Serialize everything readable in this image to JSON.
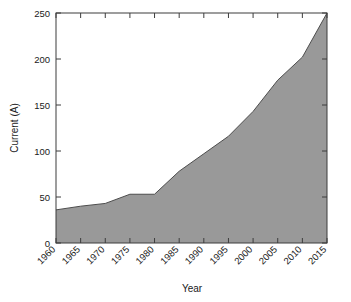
{
  "chart_data": {
    "type": "area",
    "title": "",
    "subtitle": "",
    "xlabel": "Year",
    "ylabel": "Current (A)",
    "x": [
      1960,
      1965,
      1970,
      1975,
      1980,
      1985,
      1990,
      1995,
      2000,
      2005,
      2010,
      2015
    ],
    "values": [
      36,
      40,
      43,
      53,
      53,
      78,
      97,
      116,
      143,
      177,
      202,
      250
    ],
    "series": [
      {
        "name": "Current (A)",
        "values": [
          36,
          40,
          43,
          53,
          53,
          78,
          97,
          116,
          143,
          177,
          202,
          250
        ]
      }
    ],
    "xlim": [
      1960,
      2015
    ],
    "ylim": [
      0,
      250
    ],
    "xticks": [
      1960,
      1965,
      1970,
      1975,
      1980,
      1985,
      1990,
      1995,
      2000,
      2005,
      2010,
      2015
    ],
    "yticks": [
      0,
      50,
      100,
      150,
      200,
      250
    ],
    "xtick_labels": [
      "1960",
      "1965",
      "1970",
      "1975",
      "1980",
      "1985",
      "1990",
      "1995",
      "2000",
      "2005",
      "2010",
      "2015"
    ],
    "ytick_labels": [
      "0",
      "50",
      "100",
      "150",
      "200",
      "250"
    ],
    "xtick_label_rotation": 45,
    "grid": false,
    "legend": null,
    "legend_position": "none",
    "annotations": [],
    "colors": {
      "area_fill": "#999999",
      "line": "#4d4d4d",
      "axis": "#3d3d3d",
      "text": "#1a1a1a",
      "background": "#ffffff"
    }
  },
  "axes": {
    "y_title": "Current (A)",
    "x_title": "Year"
  }
}
